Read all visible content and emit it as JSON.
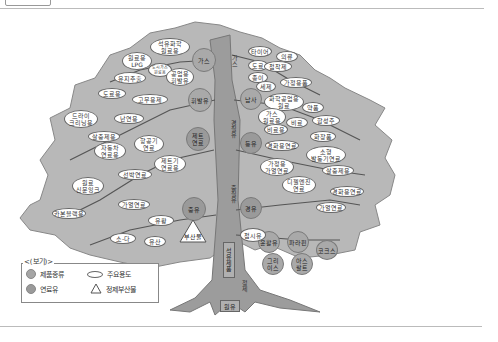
{
  "diagram": {
    "trunk": {
      "top_label": "가스",
      "mid_label": "경질유",
      "lower_label": "중질유",
      "refined": "석유제품",
      "process": "정제",
      "root": "원유"
    },
    "product_circles": [
      {
        "id": "gas",
        "label": "가스"
      },
      {
        "id": "naphtha",
        "label": "납사"
      },
      {
        "id": "volatile",
        "label": "휘발유"
      },
      {
        "id": "jet",
        "label": "제트\n연료"
      },
      {
        "id": "kerosene",
        "label": "등유"
      },
      {
        "id": "heavy",
        "label": "중유"
      },
      {
        "id": "light",
        "label": "경유"
      },
      {
        "id": "lube",
        "label": "윤활유"
      },
      {
        "id": "paraffin",
        "label": "파라핀"
      },
      {
        "id": "grease",
        "label": "그리\n이스"
      },
      {
        "id": "asphalt",
        "label": "아스\n팔트"
      },
      {
        "id": "cokes",
        "label": "코크스"
      }
    ],
    "usage_ovals": [
      {
        "id": "petchem",
        "label": "석유화학\n원료용"
      },
      {
        "id": "lpg",
        "label": "원료용\nLPG"
      },
      {
        "id": "small",
        "label": "도시가스\n원료용"
      },
      {
        "id": "oilext",
        "label": "유지추출"
      },
      {
        "id": "industrial",
        "label": "공업용\n휘발유"
      },
      {
        "id": "road1",
        "label": "도료용"
      },
      {
        "id": "rubber",
        "label": "고무용제"
      },
      {
        "id": "dryclean",
        "label": "드라이\n크리닝용"
      },
      {
        "id": "heating",
        "label": "난연용"
      },
      {
        "id": "insect",
        "label": "살충제용"
      },
      {
        "id": "car",
        "label": "자동차\n연료용"
      },
      {
        "id": "aviation",
        "label": "항공기\n연료"
      },
      {
        "id": "jetfuel",
        "label": "제트기\n연료용"
      },
      {
        "id": "ship",
        "label": "선박연료"
      },
      {
        "id": "ink",
        "label": "원료\n신문잉크"
      },
      {
        "id": "heatfuel",
        "label": "가열연료"
      },
      {
        "id": "carbon",
        "label": "카본블랙용"
      },
      {
        "id": "sulfur",
        "label": "유황"
      },
      {
        "id": "soda",
        "label": "소-다"
      },
      {
        "id": "oilseed",
        "label": "유산"
      },
      {
        "id": "tire",
        "label": "타이어"
      },
      {
        "id": "clothes",
        "label": "의류"
      },
      {
        "id": "paint",
        "label": "도료"
      },
      {
        "id": "adhesive",
        "label": "접착제"
      },
      {
        "id": "paper",
        "label": "종이"
      },
      {
        "id": "detergent",
        "label": "세제"
      },
      {
        "id": "home",
        "label": "가정용품"
      },
      {
        "id": "chemraw",
        "label": "화학공업용\n원료"
      },
      {
        "id": "drug",
        "label": "약품"
      },
      {
        "id": "fert",
        "label": "비료"
      },
      {
        "id": "synfiber",
        "label": "합성주"
      },
      {
        "id": "gasraw",
        "label": "가스\n원료용"
      },
      {
        "id": "fertuse",
        "label": "비료용"
      },
      {
        "id": "cosmetic",
        "label": "화장품"
      },
      {
        "id": "heatingfuel",
        "label": "경화용연료"
      },
      {
        "id": "smallboat",
        "label": "소형\n발동기연료"
      },
      {
        "id": "homeheat",
        "label": "가정용\n가열연료"
      },
      {
        "id": "insect2",
        "label": "살충제용"
      },
      {
        "id": "diesel",
        "label": "디젤엔진\n연료"
      },
      {
        "id": "heatfuel2",
        "label": "경화용연료"
      },
      {
        "id": "heatfuel3",
        "label": "가열연료"
      },
      {
        "id": "cloth",
        "label": "접시유"
      }
    ],
    "byproduct": {
      "label": "부산물"
    }
  },
  "legend": {
    "title": "<(보기)>",
    "items": [
      {
        "symbol": "circle",
        "label": "제품종류"
      },
      {
        "symbol": "oval",
        "label": "주요용도"
      },
      {
        "symbol": "circle",
        "label": "연료유"
      },
      {
        "symbol": "triangle",
        "label": "정제부산물"
      }
    ]
  },
  "colors": {
    "foliage": "#b8b8b8",
    "trunk": "#9c9c9c",
    "circle": "#a9a9a9",
    "branch": "#555555"
  }
}
